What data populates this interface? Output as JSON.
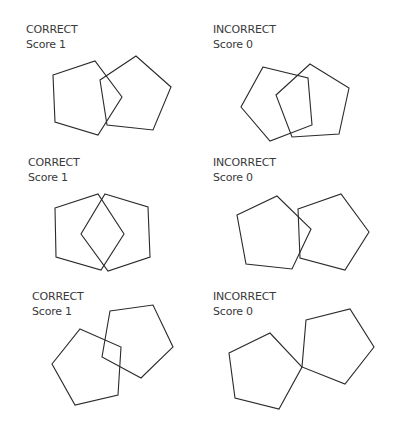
{
  "panels": [
    {
      "id": "top-left",
      "verdict": "CORRECT",
      "score": "Score 1",
      "label_pos": [
        26,
        22
      ],
      "pentagons": [
        "53,75 95,61 122,97 98,135 55,122",
        "100,80 136,56 171,87 153,130 107,125"
      ]
    },
    {
      "id": "top-right",
      "verdict": "INCORRECT",
      "score": "Score 0",
      "label_pos": [
        213,
        22
      ],
      "pentagons": [
        "263,67 308,78 312,125 270,141 241,107",
        "310,64 349,88 339,134 292,137 276,95"
      ]
    },
    {
      "id": "middle-left",
      "verdict": "CORRECT",
      "score": "Score 1",
      "label_pos": [
        28,
        155
      ],
      "pentagons": [
        "55,208 98,194 124,234 101,270 56,257",
        "105,194 148,207 150,257 108,271 81,234"
      ]
    },
    {
      "id": "middle-right",
      "verdict": "INCORRECT",
      "score": "Score 0",
      "label_pos": [
        213,
        155
      ],
      "pentagons": [
        "237,215 277,196 311,229 292,269 246,264",
        "298,209 341,194 369,232 345,270 300,258"
      ]
    },
    {
      "id": "bottom-left",
      "verdict": "CORRECT",
      "score": "Score 1",
      "label_pos": [
        32,
        289
      ],
      "pentagons": [
        "80,329 121,347 118,395 75,405 52,364",
        "110,311 153,305 173,347 141,378 102,357"
      ]
    },
    {
      "id": "bottom-right",
      "verdict": "INCORRECT",
      "score": "Score 0",
      "label_pos": [
        213,
        289
      ],
      "pentagons": [
        "229,353 270,333 302,367 279,409 235,398",
        "306,320 350,309 374,347 345,384 302,367"
      ]
    }
  ],
  "colors": {
    "stroke": "#2a2a2a",
    "text": "#3a3a3a",
    "background": "#ffffff"
  }
}
